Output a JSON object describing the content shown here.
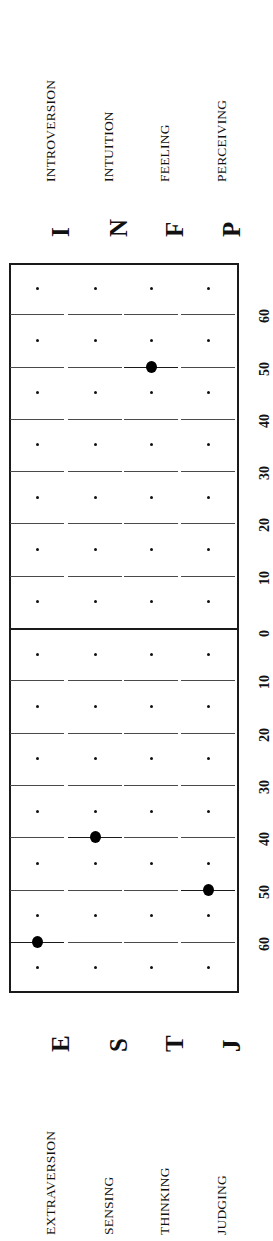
{
  "axis": {
    "label_top_half": "Introverted / Intuition / Feeling / Perceiving side",
    "label_bottom_half": "Extraverted / Sensing / Thinking / Judging side",
    "center_value": 0,
    "max_value": 65,
    "ticks_top": [
      60,
      50,
      40,
      30,
      20,
      10,
      0
    ],
    "ticks_bottom": [
      0,
      10,
      20,
      30,
      40,
      50,
      60
    ],
    "minor_tick_step": 5,
    "major_tick_step": 10
  },
  "top_poles": [
    {
      "letter": "I",
      "name": "INTROVERSION"
    },
    {
      "letter": "N",
      "name": "INTUITION"
    },
    {
      "letter": "F",
      "name": "FEELING"
    },
    {
      "letter": "P",
      "name": "PERCEIVING"
    }
  ],
  "bottom_poles": [
    {
      "letter": "E",
      "name": "EXTRAVERSION"
    },
    {
      "letter": "S",
      "name": "SENSING"
    },
    {
      "letter": "T",
      "name": "THINKING"
    },
    {
      "letter": "J",
      "name": "JUDGING"
    }
  ],
  "tick_labels_top": [
    "60",
    "50",
    "40",
    "30",
    "20",
    "10",
    "0"
  ],
  "tick_labels_bottom": [
    "0",
    "10",
    "20",
    "30",
    "40",
    "50",
    "60"
  ],
  "chart_data": {
    "type": "scatter",
    "xlabel": "",
    "ylabel": "Preference Clarity Index",
    "orientation": "rotated-90ccw",
    "axis_note": "Each of the four dichotomies is plotted on its own column; the centre line is 0 and values increase outward toward each pole.",
    "ylim": [
      -65,
      65
    ],
    "grid": true,
    "legend": false,
    "categories": [
      "E-I",
      "S-N",
      "T-F",
      "J-P"
    ],
    "points": [
      {
        "dichotomy": "E-I",
        "pole": "E",
        "opposite_pole": "I",
        "pole_name": "EXTRAVERSION",
        "opposite_name": "INTROVERSION",
        "side": "bottom",
        "value": 60
      },
      {
        "dichotomy": "S-N",
        "pole": "S",
        "opposite_pole": "N",
        "pole_name": "SENSING",
        "opposite_name": "INTUITION",
        "side": "bottom",
        "value": 40
      },
      {
        "dichotomy": "T-F",
        "pole": "F",
        "opposite_pole": "T",
        "pole_name": "FEELING",
        "opposite_name": "THINKING",
        "side": "top",
        "value": 50
      },
      {
        "dichotomy": "J-P",
        "pole": "J",
        "opposite_pole": "P",
        "pole_name": "JUDGING",
        "opposite_name": "PERCEIVING",
        "side": "bottom",
        "value": 50
      }
    ],
    "result_type": "ESFJ"
  }
}
